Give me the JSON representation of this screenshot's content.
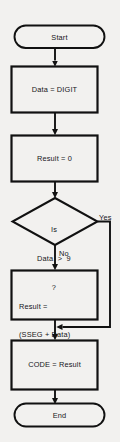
{
  "diagram": {
    "type": "flowchart",
    "background_color": "#f2f1ef",
    "line_color": "#111111",
    "shape_fill": "#f2f1ef",
    "text_color": "#16161a",
    "nodes": [
      {
        "id": "start",
        "shape": "terminal",
        "label": "Start"
      },
      {
        "id": "read",
        "shape": "process",
        "label": "Data = DIGIT"
      },
      {
        "id": "init",
        "shape": "process",
        "label": "Result = 0"
      },
      {
        "id": "decision",
        "shape": "decision",
        "label_line1": "Is",
        "label_line2": "Data  >  9",
        "label_line3": "?"
      },
      {
        "id": "compute",
        "shape": "process",
        "label_line1": "Result =",
        "label_line2": "(SSEG + Data)"
      },
      {
        "id": "output",
        "shape": "process",
        "label": "CODE = Result"
      },
      {
        "id": "end",
        "shape": "terminal",
        "label": "End"
      }
    ],
    "branch_labels": {
      "yes": "Yes",
      "no": "No"
    },
    "edges": [
      {
        "from": "start",
        "to": "read",
        "label": ""
      },
      {
        "from": "read",
        "to": "init",
        "label": ""
      },
      {
        "from": "init",
        "to": "decision",
        "label": ""
      },
      {
        "from": "decision",
        "to": "compute",
        "label": "No"
      },
      {
        "from": "decision",
        "to": "output",
        "label": "Yes"
      },
      {
        "from": "compute",
        "to": "output",
        "label": ""
      },
      {
        "from": "output",
        "to": "end",
        "label": ""
      }
    ]
  }
}
